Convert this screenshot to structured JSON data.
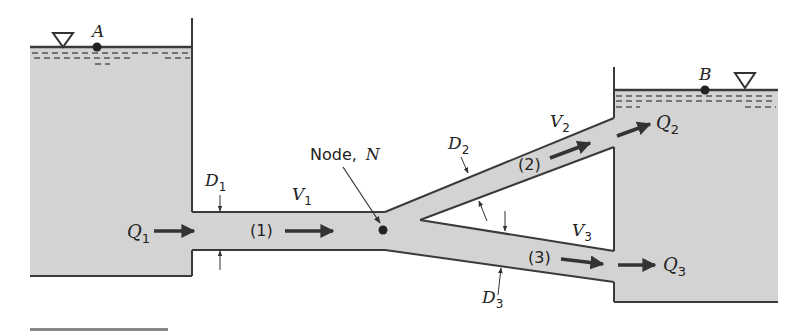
{
  "figure": {
    "type": "pipe network with two reservoirs and a branching junction",
    "colors": {
      "water": "#d3d3d3",
      "outline": "#3a3a3a",
      "text": "#222222",
      "background": "#ffffff"
    }
  },
  "reservoirs": {
    "upstream": {
      "point_label": "A",
      "surface_symbol": "free-surface-triangle"
    },
    "downstream": {
      "point_label": "B",
      "surface_symbol": "free-surface-triangle"
    }
  },
  "node": {
    "label": "Node,",
    "symbol": "N"
  },
  "pipes": [
    {
      "id": "1",
      "tag": "(1)",
      "diameter": "D",
      "diameter_sub": "1",
      "velocity": "V",
      "velocity_sub": "1"
    },
    {
      "id": "2",
      "tag": "(2)",
      "diameter": "D",
      "diameter_sub": "2",
      "velocity": "V",
      "velocity_sub": "2"
    },
    {
      "id": "3",
      "tag": "(3)",
      "diameter": "D",
      "diameter_sub": "3",
      "velocity": "V",
      "velocity_sub": "3"
    }
  ],
  "flows": [
    {
      "symbol": "Q",
      "sub": "1"
    },
    {
      "symbol": "Q",
      "sub": "2"
    },
    {
      "symbol": "Q",
      "sub": "3"
    }
  ]
}
